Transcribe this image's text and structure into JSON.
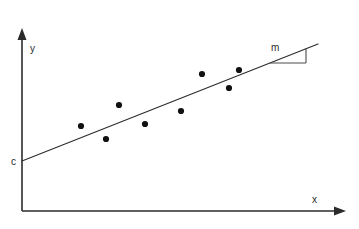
{
  "figure": {
    "background_color": "#ffffff",
    "width": 359,
    "height": 229
  },
  "labels": {
    "y_axis": "y",
    "x_axis": "x",
    "intercept": "c",
    "slope": "m"
  },
  "colors": {
    "axis": "#2b2b2b",
    "line": "#2b2b2b",
    "point": "#111111",
    "slope_triangle": "#4a4a4a"
  },
  "chart_data": {
    "type": "scatter",
    "title": "",
    "xlabel": "x",
    "ylabel": "y",
    "grid": false,
    "legend": null,
    "annotations": [
      {
        "text": "c",
        "meaning": "y-intercept of fitted line",
        "x_px": 14,
        "y_px": 162
      },
      {
        "text": "m",
        "meaning": "slope of fitted line",
        "x_px": 274,
        "y_px": 47
      }
    ],
    "axes_px": {
      "origin": [
        22,
        211
      ],
      "y_axis_top": [
        22,
        30
      ],
      "x_axis_right": [
        345,
        211
      ]
    },
    "points_px": [
      [
        81,
        126
      ],
      [
        106,
        139
      ],
      [
        119,
        105
      ],
      [
        145,
        124
      ],
      [
        181,
        111
      ],
      [
        202,
        74
      ],
      [
        229,
        88
      ],
      [
        239,
        70
      ]
    ],
    "x": [
      81,
      106,
      119,
      145,
      181,
      202,
      229,
      239
    ],
    "values": [
      126,
      139,
      105,
      124,
      111,
      74,
      88,
      70
    ],
    "fit_line_px": {
      "x1": 22,
      "y1": 161,
      "x2": 318,
      "y2": 44
    },
    "slope_triangle_px": {
      "horizontal": {
        "x1": 270,
        "y1": 63,
        "x2": 306,
        "y2": 63
      },
      "vertical": {
        "x1": 306,
        "y1": 48,
        "x2": 306,
        "y2": 63
      }
    }
  }
}
